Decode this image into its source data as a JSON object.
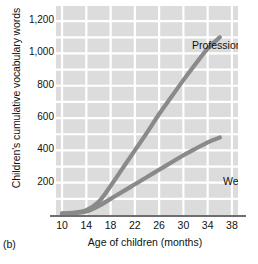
{
  "panel": {
    "letter": "(b)"
  },
  "chart_data": {
    "type": "line",
    "title": "",
    "xlabel": "Age of children (months)",
    "ylabel": "Children's cumulative vocabulary words",
    "xlim": [
      9,
      39
    ],
    "ylim": [
      0,
      1300
    ],
    "xticks": [
      10,
      14,
      18,
      22,
      26,
      30,
      34,
      38
    ],
    "xtick_labels": [
      "10",
      "14",
      "18",
      "22",
      "26",
      "30",
      "34",
      "38"
    ],
    "yticks": [
      200,
      400,
      600,
      800,
      1000,
      1200
    ],
    "ytick_labels": [
      "200",
      "400",
      "600",
      "800",
      "1,000",
      "1,200"
    ],
    "grid": true,
    "grid_color": "#ffffff",
    "plot_background": "#dcdcdc",
    "line_color": "#8a8a8a",
    "axis_color": "#6e6e6e",
    "legend_position": "inline-annotations",
    "series": [
      {
        "name": "Professional",
        "label": "Professional",
        "color": "#8a8a8a",
        "x": [
          10,
          12,
          14,
          16,
          18,
          20,
          22,
          24,
          26,
          28,
          30,
          32,
          34,
          36
        ],
        "values": [
          10,
          15,
          30,
          80,
          180,
          290,
          400,
          510,
          625,
          730,
          835,
          935,
          1030,
          1100
        ]
      },
      {
        "name": "Welfare",
        "label": "Welfare",
        "color": "#8a8a8a",
        "x": [
          10,
          12,
          14,
          16,
          18,
          20,
          22,
          24,
          26,
          28,
          30,
          32,
          34,
          36
        ],
        "values": [
          8,
          12,
          22,
          55,
          100,
          145,
          190,
          235,
          280,
          325,
          370,
          410,
          450,
          480
        ]
      }
    ]
  }
}
